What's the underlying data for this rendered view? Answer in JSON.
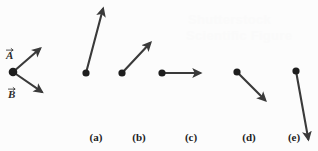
{
  "figure": {
    "background_color": "#fcfcfc",
    "stroke_color": "#3a3a3a",
    "dot_color": "#1e1e1e",
    "label_color": "#1c1c1c"
  },
  "reference_vectors": {
    "origin": {
      "x": 13,
      "y": 72
    },
    "items": [
      {
        "name": "vector-a",
        "label": "A",
        "has_overarrow": true,
        "label_x": 6,
        "label_y": 50,
        "from": {
          "x": 13,
          "y": 72
        },
        "to": {
          "x": 43,
          "y": 46
        }
      },
      {
        "name": "vector-b",
        "label": "B",
        "has_overarrow": true,
        "label_x": 8,
        "label_y": 89,
        "from": {
          "x": 13,
          "y": 72
        },
        "to": {
          "x": 45,
          "y": 94
        }
      }
    ]
  },
  "choices": [
    {
      "key": "a",
      "label": "(a)",
      "label_x": 96,
      "label_y": 141,
      "from": {
        "x": 86,
        "y": 73
      },
      "to": {
        "x": 104,
        "y": 5
      }
    },
    {
      "key": "b",
      "label": "(b)",
      "label_x": 139,
      "label_y": 141,
      "from": {
        "x": 122,
        "y": 73
      },
      "to": {
        "x": 153,
        "y": 40
      }
    },
    {
      "key": "c",
      "label": "(c)",
      "label_x": 191,
      "label_y": 141,
      "from": {
        "x": 162,
        "y": 73
      },
      "to": {
        "x": 204,
        "y": 73
      }
    },
    {
      "key": "d",
      "label": "(d)",
      "label_x": 249,
      "label_y": 141,
      "from": {
        "x": 237,
        "y": 72
      },
      "to": {
        "x": 268,
        "y": 103
      }
    },
    {
      "key": "e",
      "label": "(e)",
      "label_x": 294,
      "label_y": 141,
      "from": {
        "x": 296,
        "y": 71
      },
      "to": {
        "x": 309,
        "y": 143
      }
    }
  ],
  "watermark": {
    "line1": "Shutterstock",
    "line2": "Scientific Figure"
  }
}
